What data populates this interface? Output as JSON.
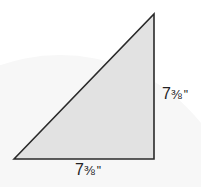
{
  "diagram": {
    "shape": "right-triangle",
    "fill_color": "#e2e2e2",
    "stroke_color": "#2a2a2a",
    "vertices": {
      "bottom_left": [
        14,
        159
      ],
      "top_right": [
        154,
        14
      ],
      "bottom_right": [
        154,
        159
      ]
    },
    "labels": {
      "right_side": {
        "whole": "7",
        "fraction": "⅜",
        "unit": "\""
      },
      "bottom_side": {
        "whole": "7",
        "fraction": "⅜",
        "unit": "\""
      }
    }
  }
}
